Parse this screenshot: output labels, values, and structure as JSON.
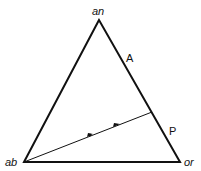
{
  "diagram": {
    "type": "ternary-triangle",
    "vertices": {
      "top": {
        "label": "an",
        "x": 99,
        "y": 20
      },
      "bottom_left": {
        "label": "ab",
        "x": 24,
        "y": 162
      },
      "bottom_right": {
        "label": "or",
        "x": 180,
        "y": 162
      }
    },
    "edge_labels": [
      {
        "label": "A",
        "x": 128,
        "y": 61
      },
      {
        "label": "P",
        "x": 171,
        "y": 134
      }
    ],
    "path_line": {
      "from": [
        24,
        162
      ],
      "to": [
        152,
        112
      ]
    },
    "arrow_points": [
      [
        90,
        135
      ],
      [
        117,
        125
      ]
    ],
    "colors": {
      "stroke": "#111111",
      "background": "#ffffff"
    }
  }
}
